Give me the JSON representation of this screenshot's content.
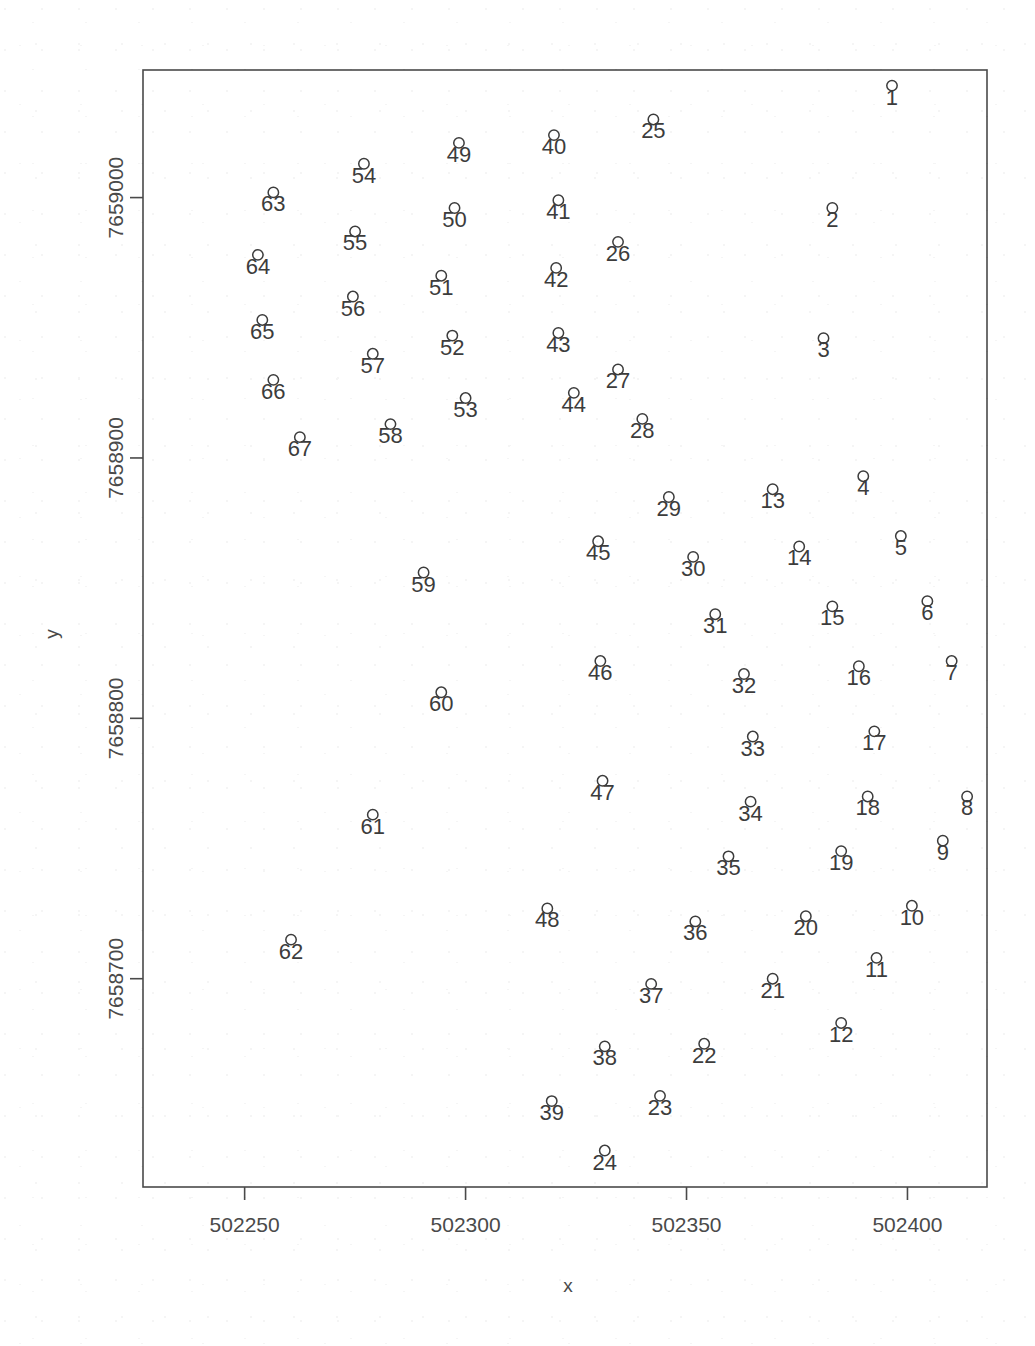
{
  "figure": {
    "plot_box": {
      "left": 143,
      "top": 70,
      "right": 987,
      "bottom": 1187
    },
    "marker_style": "open-circle",
    "marker_color": "#3c3c3c",
    "background": "#ffffff"
  },
  "chart_data": {
    "type": "scatter",
    "title": "",
    "xlabel": "x",
    "ylabel": "y",
    "grid": false,
    "legend": null,
    "xlim": [
      502227,
      502418
    ],
    "ylim": [
      7658620,
      7659049
    ],
    "xticks": [
      502250,
      502300,
      502350,
      502400
    ],
    "xticklabels": [
      "502250",
      "502300",
      "502350",
      "502400"
    ],
    "yticks": [
      7658700,
      7658800,
      7658900,
      7659000
    ],
    "yticklabels": [
      "7658700",
      "7658800",
      "7658900",
      "7659000"
    ],
    "point_labels_shown": true,
    "n_points": 67,
    "points": [
      {
        "label": "1",
        "x": 502396.5,
        "y": 7659043
      },
      {
        "label": "2",
        "x": 502383.0,
        "y": 7658996
      },
      {
        "label": "3",
        "x": 502381.0,
        "y": 7658946
      },
      {
        "label": "4",
        "x": 502390.0,
        "y": 7658893
      },
      {
        "label": "5",
        "x": 502398.5,
        "y": 7658870
      },
      {
        "label": "6",
        "x": 502404.5,
        "y": 7658845
      },
      {
        "label": "7",
        "x": 502410.0,
        "y": 7658822
      },
      {
        "label": "8",
        "x": 502413.5,
        "y": 7658770
      },
      {
        "label": "9",
        "x": 502408.0,
        "y": 7658753
      },
      {
        "label": "10",
        "x": 502401.0,
        "y": 7658728
      },
      {
        "label": "11",
        "x": 502393.0,
        "y": 7658708
      },
      {
        "label": "12",
        "x": 502385.0,
        "y": 7658683
      },
      {
        "label": "13",
        "x": 502369.5,
        "y": 7658888
      },
      {
        "label": "14",
        "x": 502375.5,
        "y": 7658866
      },
      {
        "label": "15",
        "x": 502383.0,
        "y": 7658843
      },
      {
        "label": "16",
        "x": 502389.0,
        "y": 7658820
      },
      {
        "label": "17",
        "x": 502392.5,
        "y": 7658795
      },
      {
        "label": "18",
        "x": 502391.0,
        "y": 7658770
      },
      {
        "label": "19",
        "x": 502385.0,
        "y": 7658749
      },
      {
        "label": "20",
        "x": 502377.0,
        "y": 7658724
      },
      {
        "label": "21",
        "x": 502369.5,
        "y": 7658700
      },
      {
        "label": "22",
        "x": 502354.0,
        "y": 7658675
      },
      {
        "label": "23",
        "x": 502344.0,
        "y": 7658655
      },
      {
        "label": "24",
        "x": 502331.5,
        "y": 7658634
      },
      {
        "label": "25",
        "x": 502342.5,
        "y": 7659030
      },
      {
        "label": "26",
        "x": 502334.5,
        "y": 7658983
      },
      {
        "label": "27",
        "x": 502334.5,
        "y": 7658934
      },
      {
        "label": "28",
        "x": 502340.0,
        "y": 7658915
      },
      {
        "label": "29",
        "x": 502346.0,
        "y": 7658885
      },
      {
        "label": "30",
        "x": 502351.5,
        "y": 7658862
      },
      {
        "label": "31",
        "x": 502356.5,
        "y": 7658840
      },
      {
        "label": "32",
        "x": 502363.0,
        "y": 7658817
      },
      {
        "label": "33",
        "x": 502365.0,
        "y": 7658793
      },
      {
        "label": "34",
        "x": 502364.5,
        "y": 7658768
      },
      {
        "label": "35",
        "x": 502359.5,
        "y": 7658747
      },
      {
        "label": "36",
        "x": 502352.0,
        "y": 7658722
      },
      {
        "label": "37",
        "x": 502342.0,
        "y": 7658698
      },
      {
        "label": "38",
        "x": 502331.5,
        "y": 7658674
      },
      {
        "label": "39",
        "x": 502319.5,
        "y": 7658653
      },
      {
        "label": "40",
        "x": 502320.0,
        "y": 7659024
      },
      {
        "label": "41",
        "x": 502321.0,
        "y": 7658999
      },
      {
        "label": "42",
        "x": 502320.5,
        "y": 7658973
      },
      {
        "label": "43",
        "x": 502321.0,
        "y": 7658948
      },
      {
        "label": "44",
        "x": 502324.5,
        "y": 7658925
      },
      {
        "label": "45",
        "x": 502330.0,
        "y": 7658868
      },
      {
        "label": "46",
        "x": 502330.5,
        "y": 7658822
      },
      {
        "label": "47",
        "x": 502331.0,
        "y": 7658776
      },
      {
        "label": "48",
        "x": 502318.5,
        "y": 7658727
      },
      {
        "label": "49",
        "x": 502298.5,
        "y": 7659021
      },
      {
        "label": "50",
        "x": 502297.5,
        "y": 7658996
      },
      {
        "label": "51",
        "x": 502294.5,
        "y": 7658970
      },
      {
        "label": "52",
        "x": 502297.0,
        "y": 7658947
      },
      {
        "label": "53",
        "x": 502300.0,
        "y": 7658923
      },
      {
        "label": "54",
        "x": 502277.0,
        "y": 7659013
      },
      {
        "label": "55",
        "x": 502275.0,
        "y": 7658987
      },
      {
        "label": "56",
        "x": 502274.5,
        "y": 7658962
      },
      {
        "label": "57",
        "x": 502279.0,
        "y": 7658940
      },
      {
        "label": "58",
        "x": 502283.0,
        "y": 7658913
      },
      {
        "label": "59",
        "x": 502290.5,
        "y": 7658856
      },
      {
        "label": "60",
        "x": 502294.5,
        "y": 7658810
      },
      {
        "label": "61",
        "x": 502279.0,
        "y": 7658763
      },
      {
        "label": "62",
        "x": 502260.5,
        "y": 7658715
      },
      {
        "label": "63",
        "x": 502256.5,
        "y": 7659002
      },
      {
        "label": "64",
        "x": 502253.0,
        "y": 7658978
      },
      {
        "label": "65",
        "x": 502254.0,
        "y": 7658953
      },
      {
        "label": "66",
        "x": 502256.5,
        "y": 7658930
      },
      {
        "label": "67",
        "x": 502262.5,
        "y": 7658908
      }
    ]
  }
}
